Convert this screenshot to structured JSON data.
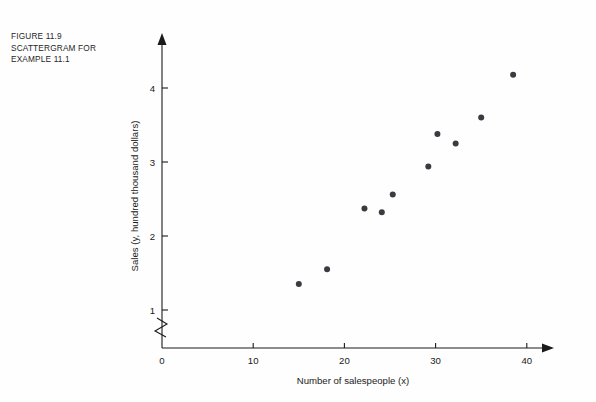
{
  "figure": {
    "caption_lines": [
      "FIGURE 11.9",
      "SCATTERGRAM FOR",
      "EXAMPLE 11.1"
    ],
    "background_color": "#fefefe",
    "ink_color": "#1a1a1a",
    "point_color": "#3a3a40"
  },
  "chart_data": {
    "type": "scatter",
    "title": "",
    "xlabel": "Number of salespeople (x)",
    "ylabel": "Sales (y, hundred thousand dollars)",
    "xlim": [
      0,
      42
    ],
    "ylim": [
      0,
      4.55
    ],
    "xticks": [
      0,
      10,
      20,
      30,
      40
    ],
    "xticklabels": [
      "0",
      "10",
      "20",
      "30",
      "40"
    ],
    "yticks": [
      1,
      2,
      3,
      4
    ],
    "yticklabels": [
      "1",
      "2",
      "3",
      "4"
    ],
    "grid": false,
    "legend": null,
    "y_axis_break": true,
    "y_axis_break_between": [
      0,
      1
    ],
    "series": [
      {
        "name": "Sales vs salespeople",
        "marker": "filled-circle",
        "points": [
          {
            "x": 15.0,
            "y": 1.35
          },
          {
            "x": 18.1,
            "y": 1.55
          },
          {
            "x": 22.2,
            "y": 2.37
          },
          {
            "x": 24.1,
            "y": 2.32
          },
          {
            "x": 25.3,
            "y": 2.56
          },
          {
            "x": 29.2,
            "y": 2.94
          },
          {
            "x": 30.2,
            "y": 3.38
          },
          {
            "x": 32.2,
            "y": 3.25
          },
          {
            "x": 35.0,
            "y": 3.6
          },
          {
            "x": 38.5,
            "y": 4.18
          }
        ]
      }
    ],
    "point_count": 10
  }
}
